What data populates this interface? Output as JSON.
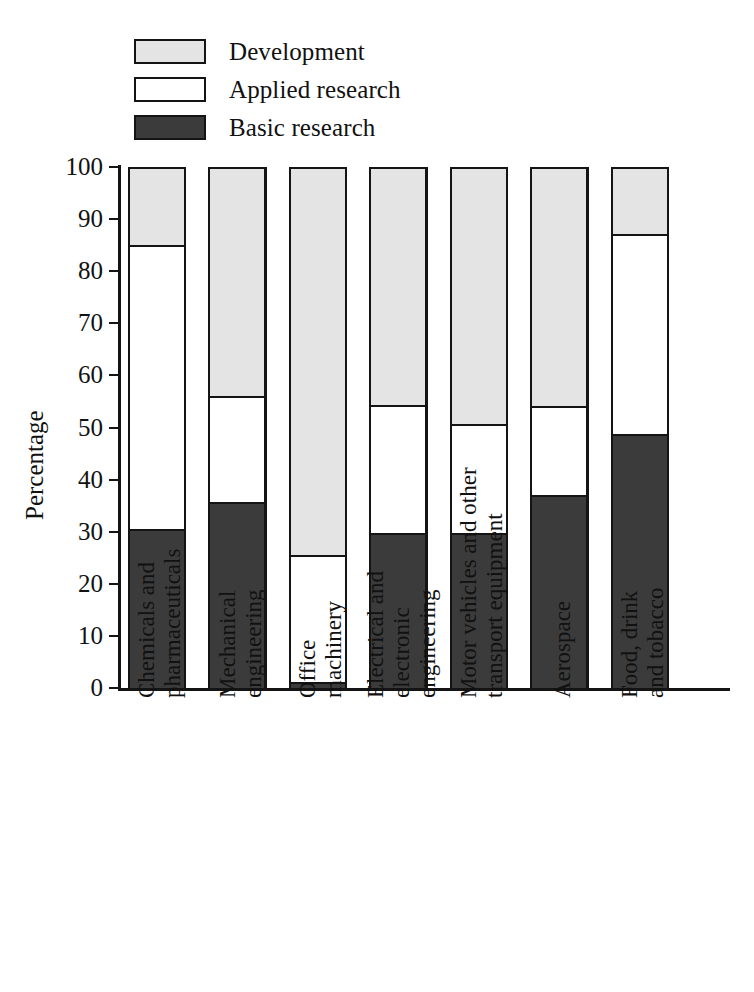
{
  "chart_data": {
    "type": "bar",
    "subtype": "stacked-bar-100-percent",
    "title": "",
    "xlabel": "",
    "ylabel": "Percentage",
    "ylim": [
      0,
      100
    ],
    "ytick_step": 10,
    "yticks": [
      0,
      10,
      20,
      30,
      40,
      50,
      60,
      70,
      80,
      90,
      100
    ],
    "grid": false,
    "legend_position": "top-left",
    "categories": [
      "Chemicals and pharmaceuticals",
      "Mechanical engineering",
      "Office machinery",
      "Electrical and electronic engineering",
      "Motor vehicles and other transport equipment",
      "Aerospace",
      "Food, drink and tobacco"
    ],
    "series": [
      {
        "name": "Basic research",
        "color": "#3b3b3b",
        "values": [
          30.5,
          35.7,
          1.0,
          29.7,
          29.7,
          37.0,
          48.7
        ]
      },
      {
        "name": "Applied research",
        "color": "#ffffff",
        "values": [
          54.5,
          20.3,
          24.5,
          24.6,
          20.8,
          17.0,
          38.3
        ]
      },
      {
        "name": "Development",
        "color": "#e4e4e4",
        "values": [
          15.0,
          44.0,
          74.5,
          45.7,
          49.5,
          46.0,
          13.0
        ]
      }
    ],
    "cumulative_tops": {
      "basic": [
        30.5,
        35.7,
        1.0,
        29.7,
        29.7,
        37.0,
        48.7
      ],
      "applied": [
        85.0,
        56.0,
        25.5,
        54.3,
        50.5,
        54.0,
        87.0
      ],
      "development": [
        100,
        100,
        100,
        100,
        100,
        100,
        100
      ]
    }
  },
  "legend": {
    "items": [
      {
        "label": "Development",
        "color": "#e4e4e4"
      },
      {
        "label": "Applied research",
        "color": "#ffffff"
      },
      {
        "label": "Basic research",
        "color": "#3b3b3b"
      }
    ]
  },
  "axis": {
    "y_title": "Percentage",
    "y_tick_labels": [
      "100",
      "90",
      "80",
      "70",
      "60",
      "50",
      "40",
      "30",
      "20",
      "10",
      "0"
    ]
  },
  "category_labels": [
    {
      "line1": "Chemicals and",
      "line2": "pharmaceuticals"
    },
    {
      "line1": "Mechanical",
      "line2": "engineering"
    },
    {
      "line1": "Office",
      "line2": "machinery"
    },
    {
      "line1": "Electrical and",
      "line2": "electronic",
      "line3": "engineering"
    },
    {
      "line1": "Motor vehicles and other",
      "line2": "transport equipment"
    },
    {
      "line1": "Aerospace",
      "line2": ""
    },
    {
      "line1": "Food, drink",
      "line2": "and tobacco"
    }
  ]
}
